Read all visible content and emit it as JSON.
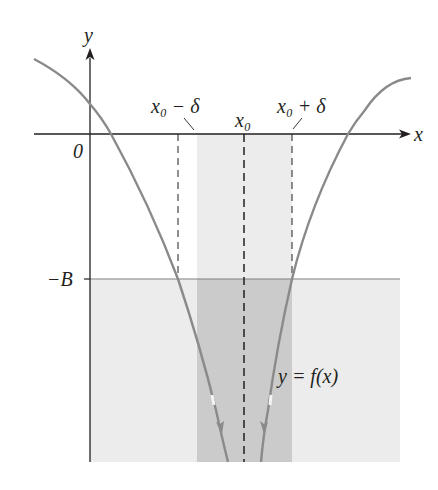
{
  "figure": {
    "axis_labels": {
      "x": "x",
      "y": "y",
      "origin": "0"
    },
    "tick_labels": {
      "x0_minus_delta": "x₀ − δ",
      "x0": "x₀",
      "x0_plus_delta": "x₀ + δ",
      "neg_B": "−B"
    },
    "curve_label": "y = f(x)",
    "colors": {
      "curve": "#8a8a8a",
      "axes": "#231f20",
      "shade_light": "#ececec",
      "shade_mid": "#e0e0e0",
      "shade_dark": "#c9c9c9",
      "dashed": "#231f20",
      "B_line": "#808080"
    }
  }
}
